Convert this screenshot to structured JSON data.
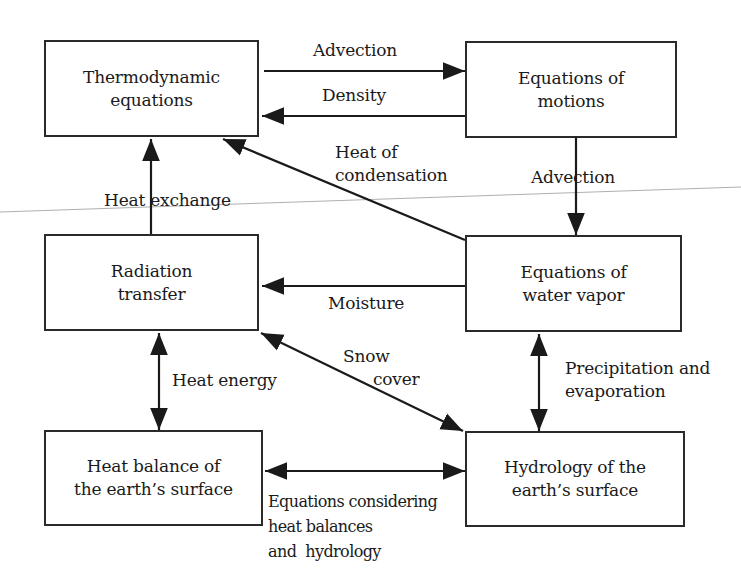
{
  "diagram": {
    "type": "flow",
    "nodes": [
      {
        "id": "thermo",
        "lines": [
          "Thermodynamic",
          "equations"
        ]
      },
      {
        "id": "motion",
        "lines": [
          "Equations of",
          "motions"
        ]
      },
      {
        "id": "radiation",
        "lines": [
          "Radiation",
          "transfer"
        ]
      },
      {
        "id": "vapor",
        "lines": [
          "Equations of",
          "water vapor"
        ]
      },
      {
        "id": "heatbal",
        "lines": [
          "Heat balance of",
          "the earth’s surface"
        ]
      },
      {
        "id": "hydro",
        "lines": [
          "Hydrology of the",
          "earth’s surface"
        ]
      }
    ],
    "edges": [
      {
        "from": "thermo",
        "to": "motion",
        "label": [
          "Advection"
        ],
        "direction": "forward"
      },
      {
        "from": "motion",
        "to": "thermo",
        "label": [
          "Density"
        ],
        "direction": "forward"
      },
      {
        "from": "motion",
        "to": "vapor",
        "label": [
          "Advection"
        ],
        "direction": "forward"
      },
      {
        "from": "vapor",
        "to": "thermo",
        "label": [
          "Heat of",
          "condensation"
        ],
        "direction": "forward"
      },
      {
        "from": "radiation",
        "to": "thermo",
        "label": [
          "Heat exchange"
        ],
        "direction": "forward"
      },
      {
        "from": "vapor",
        "to": "radiation",
        "label": [
          "Moisture"
        ],
        "direction": "forward"
      },
      {
        "from": "radiation",
        "to": "heatbal",
        "label": [
          "Heat energy"
        ],
        "direction": "both"
      },
      {
        "from": "radiation",
        "to": "hydro",
        "label": [
          "Snow",
          "cover"
        ],
        "direction": "both"
      },
      {
        "from": "vapor",
        "to": "hydro",
        "label": [
          "Precipitation and",
          "evaporation"
        ],
        "direction": "both"
      },
      {
        "from": "heatbal",
        "to": "hydro",
        "label": [
          "Equations considering",
          "heat balances",
          "and  hydrology"
        ],
        "direction": "both"
      }
    ]
  },
  "colors": {
    "line": "#1a1a1a",
    "background": "#ffffff",
    "scan_line": "#9a9a9a"
  }
}
